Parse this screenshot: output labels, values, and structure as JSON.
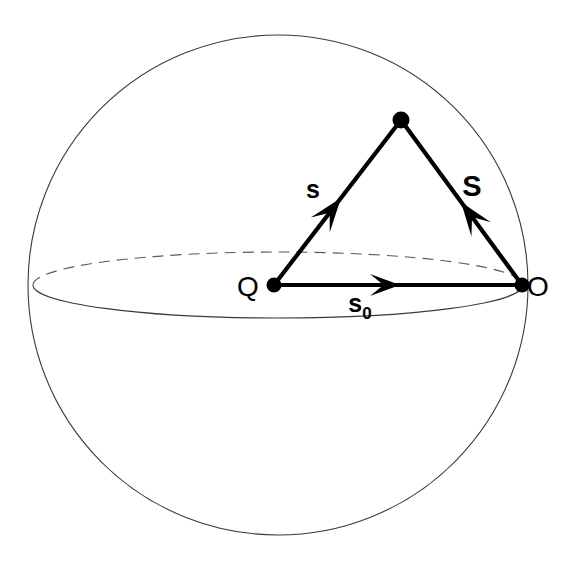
{
  "figure": {
    "kind": "scattering-geometry-sphere-diagram",
    "background_color": "#ffffff",
    "ink_color": "#000000",
    "outline_color": "#3a3a3a"
  },
  "sphere": {
    "name": "Ewald sphere outline",
    "center_x": 278,
    "center_y": 285,
    "radius": 250,
    "stroke_color": "#3a3a3a"
  },
  "equator": {
    "name": "equatorial great circle",
    "center_x": 278,
    "center_y": 285,
    "radius_x": 245,
    "radius_y": 33,
    "front_style": "solid",
    "back_style": "dashed"
  },
  "points": [
    {
      "id": "Q",
      "label": "Q",
      "x": 274,
      "y": 285,
      "dot_r": 7.5,
      "label_x": 248,
      "label_y": 296
    },
    {
      "id": "apex",
      "label": "",
      "x": 401,
      "y": 120,
      "dot_r": 8.5,
      "label_x": 401,
      "label_y": 120
    },
    {
      "id": "O",
      "label": "O",
      "x": 522,
      "y": 285,
      "dot_r": 7.5,
      "label_x": 534,
      "label_y": 296
    }
  ],
  "vectors": [
    {
      "id": "s",
      "label": "s",
      "from": "Q",
      "to": "apex",
      "x1": 274,
      "y1": 285,
      "x2": 401,
      "y2": 120,
      "arrow_at_x": 341,
      "arrow_at_y": 198,
      "label_x": 313,
      "label_y": 198,
      "label_style": "bold-lowercase"
    },
    {
      "id": "S",
      "label": "S",
      "from": "O",
      "to": "apex",
      "x1": 522,
      "y1": 285,
      "x2": 401,
      "y2": 120,
      "arrow_at_x": 461,
      "arrow_at_y": 202,
      "label_x": 468,
      "label_y": 196,
      "label_style": "bold-uppercase"
    },
    {
      "id": "s0",
      "label": "s",
      "subscript": "0",
      "from": "Q",
      "to": "O",
      "x1": 274,
      "y1": 285,
      "x2": 522,
      "y2": 285,
      "arrow_at_x": 400,
      "arrow_at_y": 285,
      "label_x": 360,
      "label_y": 312,
      "label_style": "bold-lowercase-subscript"
    }
  ],
  "labels": {
    "point_q": "Q",
    "point_o": "O",
    "vector_s": "s",
    "vector_S_cap": "S",
    "vector_s0_base": "s",
    "vector_s0_sub": "0"
  }
}
